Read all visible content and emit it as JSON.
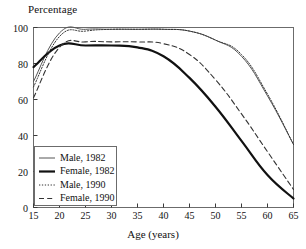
{
  "chart_data": {
    "type": "line",
    "title": "",
    "ylabel": "Percentage",
    "xlabel": "Age (years)",
    "xlim": [
      15,
      65
    ],
    "ylim": [
      0,
      100
    ],
    "xticks": [
      15,
      20,
      25,
      30,
      35,
      40,
      45,
      50,
      55,
      60,
      65
    ],
    "yticks": [
      0,
      20,
      40,
      60,
      80,
      100
    ],
    "grid": false,
    "legend_position": "lower-left",
    "x": [
      15,
      20,
      25,
      30,
      35,
      40,
      45,
      50,
      55,
      60,
      65
    ],
    "series": [
      {
        "name": "Male, 1982",
        "style": "solid-thin",
        "color": "#555555",
        "values": [
          70,
          97,
          99,
          99,
          99,
          99,
          98,
          93,
          84,
          62,
          35
        ]
      },
      {
        "name": "Female, 1982",
        "style": "solid-thick",
        "color": "#111111",
        "values": [
          78,
          90,
          90,
          90,
          89,
          84,
          72,
          56,
          37,
          18,
          5
        ]
      },
      {
        "name": "Male, 1990",
        "style": "dotted",
        "color": "#333333",
        "values": [
          67,
          95,
          98,
          99,
          99,
          99,
          98,
          93,
          85,
          63,
          35
        ]
      },
      {
        "name": "Female, 1990",
        "style": "dashed",
        "color": "#333333",
        "values": [
          61,
          89,
          92,
          92,
          92,
          91,
          85,
          71,
          52,
          31,
          10
        ]
      }
    ]
  },
  "axes": {
    "y_title": "Percentage",
    "x_title": "Age (years)",
    "x_tick_labels": [
      "15",
      "20",
      "25",
      "30",
      "35",
      "40",
      "45",
      "50",
      "55",
      "60",
      "65"
    ],
    "y_tick_labels": [
      "0",
      "20",
      "40",
      "60",
      "80",
      "100"
    ]
  },
  "legend": {
    "entries": [
      {
        "label": "Male, 1982"
      },
      {
        "label": "Female, 1982"
      },
      {
        "label": "Male, 1990"
      },
      {
        "label": "Female, 1990"
      }
    ]
  }
}
